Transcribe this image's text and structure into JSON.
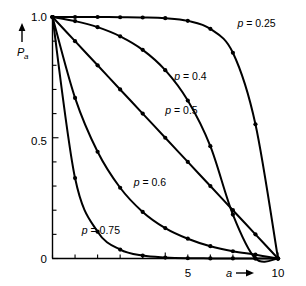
{
  "chart_data": {
    "type": "line",
    "title": "",
    "subtitle": "",
    "xlabel": "a",
    "ylabel": "P",
    "ylabel_sub": "a",
    "xlim": [
      0,
      10
    ],
    "ylim": [
      0,
      1.0
    ],
    "grid": false,
    "legend_position": "inline-annotations",
    "x_ticks": [
      0,
      1,
      2,
      3,
      4,
      5,
      6,
      7,
      8,
      9,
      10
    ],
    "x_tick_labels": [
      "",
      "",
      "",
      "",
      "",
      "5",
      "",
      "",
      "",
      "",
      "10"
    ],
    "y_ticks": [
      0,
      0.1,
      0.2,
      0.3,
      0.4,
      0.5,
      0.6,
      0.7,
      0.8,
      0.9,
      1.0
    ],
    "y_tick_labels": [
      "0",
      "",
      "",
      "",
      "",
      "0.5",
      "",
      "",
      "",
      "",
      "1.0"
    ],
    "x": [
      0,
      1,
      2,
      3,
      4,
      5,
      6,
      7,
      8,
      9,
      10
    ],
    "series": [
      {
        "name": "p = 0.25",
        "label": "p = 0.25",
        "p": 0.25,
        "values": [
          1.0,
          1.0,
          1.0,
          0.999,
          0.998,
          0.995,
          0.984,
          0.951,
          0.852,
          0.556,
          0.0
        ]
      },
      {
        "name": "p = 0.4",
        "label": "p = 0.4",
        "p": 0.4,
        "values": [
          1.0,
          0.983,
          0.958,
          0.92,
          0.864,
          0.78,
          0.654,
          0.465,
          0.182,
          0.0,
          0.0
        ]
      },
      {
        "name": "p = 0.5",
        "label": "p = 0.5",
        "p": 0.5,
        "values": [
          1.0,
          0.9,
          0.8,
          0.7,
          0.6,
          0.5,
          0.4,
          0.3,
          0.2,
          0.1,
          0.0
        ]
      },
      {
        "name": "p = 0.6",
        "label": "p = 0.6",
        "p": 0.6,
        "values": [
          1.0,
          0.665,
          0.442,
          0.293,
          0.193,
          0.126,
          0.082,
          0.051,
          0.03,
          0.016,
          0.0
        ]
      },
      {
        "name": "p = 0.75",
        "label": "p = 0.75",
        "p": 0.75,
        "values": [
          1.0,
          0.333,
          0.111,
          0.037,
          0.012,
          0.004,
          0.001,
          0.0005,
          0.0002,
          0.0001,
          0.0
        ]
      }
    ],
    "annotations": [
      {
        "text": "p = 0.25",
        "x": 8.2,
        "y": 0.96
      },
      {
        "text": "p = 0.4",
        "x": 5.4,
        "y": 0.74
      },
      {
        "text": "p = 0.5",
        "x": 5.0,
        "y": 0.6
      },
      {
        "text": "p = 0.6",
        "x": 3.6,
        "y": 0.3
      },
      {
        "text": "p = 0.75",
        "x": 1.3,
        "y": 0.1
      }
    ]
  },
  "axes": {
    "y_label_text": "P",
    "y_label_sub": "a",
    "y_arrow": "up-arrow",
    "x_label_text": "a",
    "x_arrow": "right-arrow",
    "y_tick_1": "1.0",
    "y_tick_05": "0.5",
    "y_tick_0": "0",
    "x_tick_5": "5",
    "x_tick_10": "10"
  },
  "colors": {
    "ink": "#000000",
    "background": "#ffffff"
  }
}
